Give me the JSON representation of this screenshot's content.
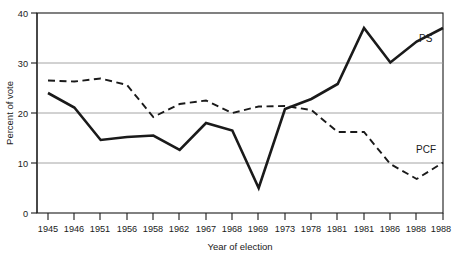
{
  "chart_data": {
    "type": "line",
    "title": "",
    "xlabel": "Year of election",
    "ylabel": "Percent of vote",
    "categories": [
      "1945",
      "1946",
      "1951",
      "1956",
      "1958",
      "1962",
      "1967",
      "1968",
      "1969",
      "1973",
      "1978",
      "1981",
      "1981",
      "1986",
      "1988",
      "1988"
    ],
    "ylim": [
      0,
      40
    ],
    "yticks": [
      0,
      10,
      20,
      30,
      40
    ],
    "ytick_labels": [
      "0",
      "10",
      "20",
      "30",
      "40"
    ],
    "grid": true,
    "grid_axis": "y",
    "legend_position": "inline-right",
    "series": [
      {
        "name": "PS",
        "style": "solid",
        "color": "#1a1a1a",
        "label_text": "PS",
        "values": [
          24.0,
          21.1,
          14.6,
          15.2,
          15.5,
          12.6,
          18.0,
          16.5,
          5.0,
          20.8,
          22.8,
          25.8,
          37.0,
          30.1,
          34.3,
          37.0
        ]
      },
      {
        "name": "PCF",
        "style": "dashed",
        "color": "#1a1a1a",
        "label_text": "PCF",
        "values": [
          26.5,
          26.3,
          26.9,
          25.6,
          19.2,
          21.8,
          22.5,
          20.0,
          21.3,
          21.4,
          20.6,
          16.2,
          16.2,
          9.8,
          6.8,
          10.1
        ]
      }
    ]
  },
  "axes": {
    "y_axis_title": "Percent of vote",
    "x_axis_title": "Year of election"
  }
}
